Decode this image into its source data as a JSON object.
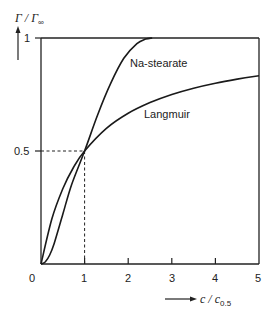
{
  "chart_data": {
    "type": "line",
    "title": "",
    "xlabel": "c / c0.5",
    "ylabel": "Γ / Γ∞",
    "xlim": [
      0,
      5
    ],
    "ylim": [
      0,
      1
    ],
    "x_ticks": [
      "0",
      "1",
      "2",
      "3",
      "4",
      "5"
    ],
    "y_ticks": [
      "0.5",
      "1"
    ],
    "grid": false,
    "legend": "inline labels",
    "reference_lines": [
      {
        "type": "dashed",
        "from": [
          0,
          0.5
        ],
        "to": [
          1,
          0.5
        ]
      },
      {
        "type": "dashed",
        "from": [
          1,
          0
        ],
        "to": [
          1,
          0.5
        ]
      }
    ],
    "series": [
      {
        "name": "Na-stearate",
        "shape": "sigmoidal",
        "x": [
          0,
          0.1,
          0.2,
          0.3,
          0.5,
          0.7,
          1.0,
          1.3,
          1.6,
          1.9,
          2.2,
          2.4,
          2.55
        ],
        "values": [
          0,
          0.01,
          0.04,
          0.09,
          0.22,
          0.35,
          0.5,
          0.66,
          0.8,
          0.91,
          0.975,
          0.995,
          1.0
        ]
      },
      {
        "name": "Langmuir",
        "shape": "hyperbolic x/(1+x)",
        "x": [
          0,
          0.25,
          0.5,
          0.75,
          1.0,
          1.5,
          2.0,
          2.5,
          3.0,
          3.5,
          4.0,
          4.5,
          5.0
        ],
        "values": [
          0,
          0.2,
          0.333,
          0.429,
          0.5,
          0.6,
          0.667,
          0.714,
          0.75,
          0.778,
          0.8,
          0.818,
          0.833
        ]
      }
    ]
  },
  "labels": {
    "y_axis": "Γ / Γ",
    "y_axis_sub": "∞",
    "x_axis": "c / c",
    "x_axis_sub": "0.5",
    "x_ticks": [
      "0",
      "1",
      "2",
      "3",
      "4",
      "5"
    ],
    "y_tick_1": "1",
    "y_tick_05": "0.5",
    "series_na": "Na-stearate",
    "series_langmuir": "Langmuir"
  }
}
